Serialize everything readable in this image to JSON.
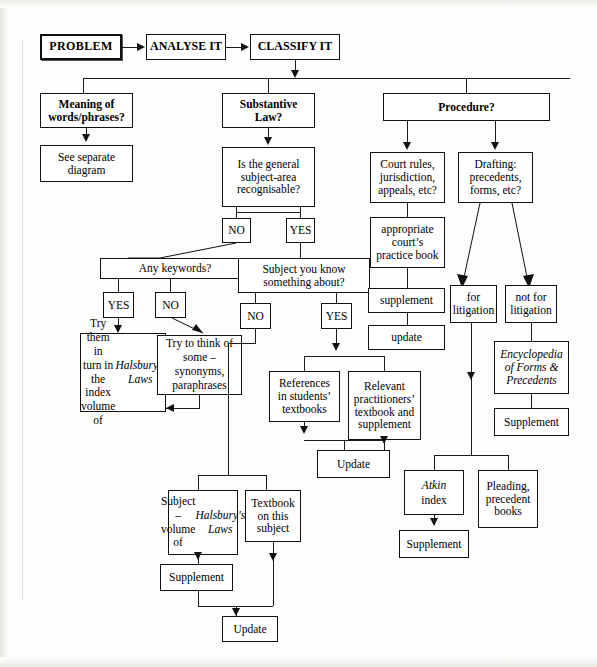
{
  "diagram": {
    "nodes": {
      "problem": "PROBLEM",
      "analyse": "ANALYSE IT",
      "classify": "CLASSIFY IT",
      "meaning": "Meaning of\nwords/phrases?",
      "see_separate": "See separate\ndiagram",
      "substantive": "Substantive\nLaw?",
      "general_subject": "Is the general\nsubject-area\nrecognisable?",
      "gs_no": "NO",
      "gs_yes": "YES",
      "any_keywords": "Any keywords?",
      "kw_yes": "YES",
      "kw_no": "NO",
      "try_them": "Try them in\nturn in the\nindex volume\nof ",
      "try_them_ital": "Halsbury's\nLaws",
      "try_think": "Try to think of\nsome –\nsynonyms,\nparaphrases",
      "subject_know": "Subject you know\nsomething about?",
      "sk_no": "NO",
      "sk_yes": "YES",
      "references_students": "References\nin students’\ntextbooks",
      "relevant_practitioners": "Relevant\npractitioners’\ntextbook and\nsupplement",
      "update_mid": "Update",
      "subject_volume": "Subject –\nvolume of\n",
      "subject_volume_ital": "Halsbury's\nLaws",
      "textbook_subject": "Textbook\non this\nsubject",
      "supplement_left": "Supplement",
      "update_bottom": "Update",
      "procedure": "Procedure?",
      "court_rules": "Court rules,\njurisdiction,\nappeals, etc?",
      "practice_book": "appropriate\ncourt’s\npractice book",
      "supplement_proc": "supplement",
      "update_proc": "update",
      "drafting": "Drafting:\nprecedents,\nforms, etc?",
      "for_litigation": "for\nlitigation",
      "not_for_litigation": "not for\nlitigation",
      "encyclopedia": "Encyclopedia\nof Forms &\nPrecedents",
      "supplement_enc": "Supplement",
      "atkin": "Atkin",
      "atkin_index": "index",
      "supplement_atkin": "Supplement",
      "pleading": "Pleading,\nprecedent\nbooks"
    },
    "colors": {
      "line": "#1b1b1b",
      "box_border": "#111111",
      "background": "#fdfdfc"
    }
  }
}
